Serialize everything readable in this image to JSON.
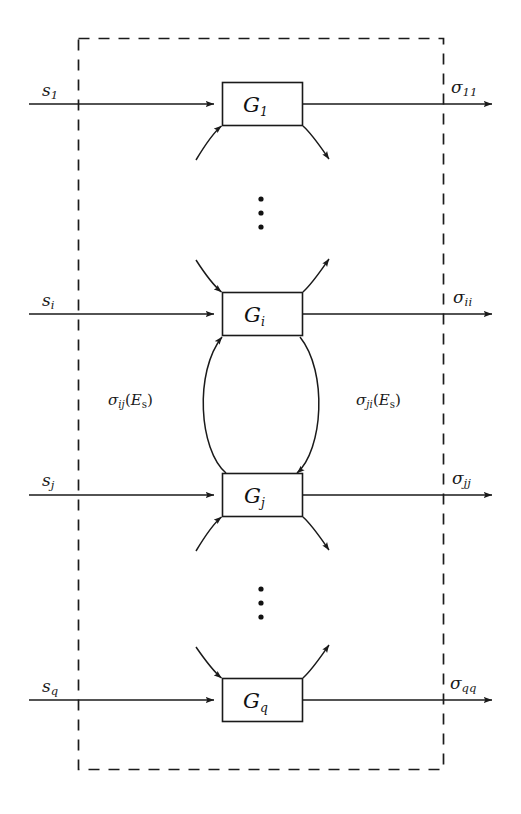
{
  "figure": {
    "kind": "block-diagram",
    "width": 521,
    "height": 814,
    "colors": {
      "background": "#ffffff",
      "stroke": "#1a1a1a",
      "boundary": "#1a1a1a"
    }
  },
  "boundary": {
    "name": "system-boundary",
    "style": "dashed"
  },
  "rows": [
    {
      "id": "row-1",
      "input_label": "s",
      "input_sub": "1",
      "block_label": "G",
      "block_sub": "1",
      "output_label": "σ",
      "output_sub": "11"
    },
    {
      "id": "row-i",
      "input_label": "s",
      "input_sub": "i",
      "block_label": "G",
      "block_sub": "i",
      "output_label": "σ",
      "output_sub": "ii"
    },
    {
      "id": "row-j",
      "input_label": "s",
      "input_sub": "j",
      "block_label": "G",
      "block_sub": "j",
      "output_label": "σ",
      "output_sub": "jj"
    },
    {
      "id": "row-q",
      "input_label": "s",
      "input_sub": "q",
      "block_label": "G",
      "block_sub": "q",
      "output_label": "σ",
      "output_sub": "qq"
    }
  ],
  "coupling": {
    "left": {
      "symbol": "σ",
      "sub": "ij",
      "arg_open": "(",
      "arg_symbol": "E",
      "arg_sub": "s",
      "arg_close": ")"
    },
    "right": {
      "symbol": "σ",
      "sub": "ji",
      "arg_open": "(",
      "arg_symbol": "E",
      "arg_sub": "s",
      "arg_close": ")"
    }
  },
  "ellipses": [
    {
      "id": "vdots-upper",
      "glyph": "⋮"
    },
    {
      "id": "vdots-lower",
      "glyph": "⋮"
    }
  ]
}
